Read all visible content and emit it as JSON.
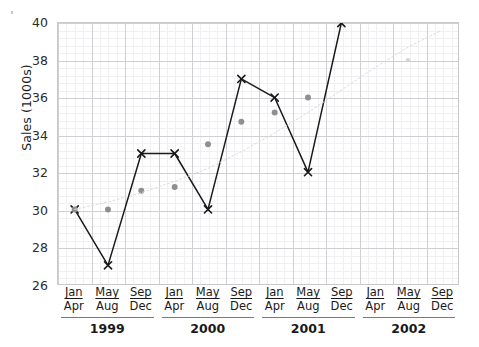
{
  "chart_data": {
    "type": "line",
    "title": "",
    "xlabel": "",
    "ylabel": "Sales (1000s)",
    "ylim": [
      26,
      40
    ],
    "ytick_labels": [
      "26",
      "28",
      "30",
      "32",
      "34",
      "36",
      "38",
      "40"
    ],
    "ytick_values": [
      26,
      28,
      30,
      32,
      34,
      36,
      38,
      40
    ],
    "grid": true,
    "legend": "none",
    "categories": [
      "Jan Apr 1999",
      "May Aug 1999",
      "Sep Dec 1999",
      "Jan Apr 2000",
      "May Aug 2000",
      "Sep Dec 2000",
      "Jan Apr 2001",
      "May Aug 2001",
      "Sep Dec 2001",
      "Jan Apr 2002",
      "May Aug 2002",
      "Sep Dec 2002"
    ],
    "x_quarter_labels": [
      {
        "m1": "Jan",
        "m2": "Apr"
      },
      {
        "m1": "May",
        "m2": "Aug"
      },
      {
        "m1": "Sep",
        "m2": "Dec"
      },
      {
        "m1": "Jan",
        "m2": "Apr"
      },
      {
        "m1": "May",
        "m2": "Aug"
      },
      {
        "m1": "Sep",
        "m2": "Dec"
      },
      {
        "m1": "Jan",
        "m2": "Apr"
      },
      {
        "m1": "May",
        "m2": "Aug"
      },
      {
        "m1": "Sep",
        "m2": "Dec"
      },
      {
        "m1": "Jan",
        "m2": "Apr"
      },
      {
        "m1": "May",
        "m2": "Aug"
      },
      {
        "m1": "Sep",
        "m2": "Dec"
      }
    ],
    "year_labels": [
      "1999",
      "2000",
      "2001",
      "2002"
    ],
    "series": [
      {
        "name": "Actual sales",
        "marker": "x",
        "color": "#1a1a1a",
        "line": "solid",
        "values": [
          30,
          27,
          33,
          33,
          30,
          37,
          36,
          32,
          40,
          null,
          null,
          null
        ]
      },
      {
        "name": "Trend",
        "marker": "dot",
        "color": "#8f8f8f",
        "line": "none",
        "values": [
          30,
          30,
          31,
          31.2,
          33.5,
          34.7,
          35.2,
          36,
          null,
          null,
          38,
          null
        ]
      },
      {
        "name": "Trend projection",
        "marker": "none",
        "color": "#dcdcdc",
        "line": "dotted",
        "values": [
          30,
          30.4,
          30.9,
          31.5,
          32.2,
          33.1,
          34.1,
          35.2,
          36.4,
          37.6,
          38.7,
          39.6
        ]
      }
    ]
  },
  "axis": {
    "y_title": "Sales (1000s)"
  }
}
